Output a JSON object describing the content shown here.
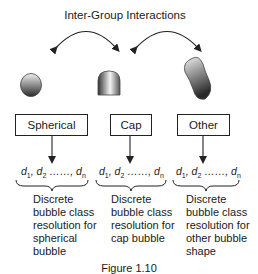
{
  "title": "Inter-Group Interactions",
  "groups": [
    {
      "shape_icon": "sphere-bubble-icon",
      "label": "Spherical",
      "classes": {
        "d1": "d",
        "s1": "1",
        "d2": "d",
        "s2": "2",
        "dots": "……",
        "dn": "d",
        "sn": "n"
      },
      "description": [
        "Discrete",
        "bubble class",
        "resolution for",
        "spherical",
        "bubble"
      ]
    },
    {
      "shape_icon": "cap-bubble-icon",
      "label": "Cap",
      "classes": {
        "d1": "d",
        "s1": "1",
        "d2": "d",
        "s2": "2",
        "dots": "……",
        "dn": "d",
        "sn": "n"
      },
      "description": [
        "Discrete",
        "bubble class",
        "resolution for",
        "cap bubble"
      ]
    },
    {
      "shape_icon": "irregular-bubble-icon",
      "label": "Other",
      "classes": {
        "d1": "d",
        "s1": "1",
        "d2": "d",
        "s2": "2",
        "dots": "……",
        "dn": "d",
        "sn": "n"
      },
      "description": [
        "Discrete",
        "bubble class",
        "resolution for",
        "other bubble",
        "shape"
      ]
    }
  ],
  "caption": "Figure 1.10",
  "colors": {
    "stroke": "#222222",
    "shape_light": "#f2f2f2",
    "shape_dark": "#2a2a2a"
  }
}
